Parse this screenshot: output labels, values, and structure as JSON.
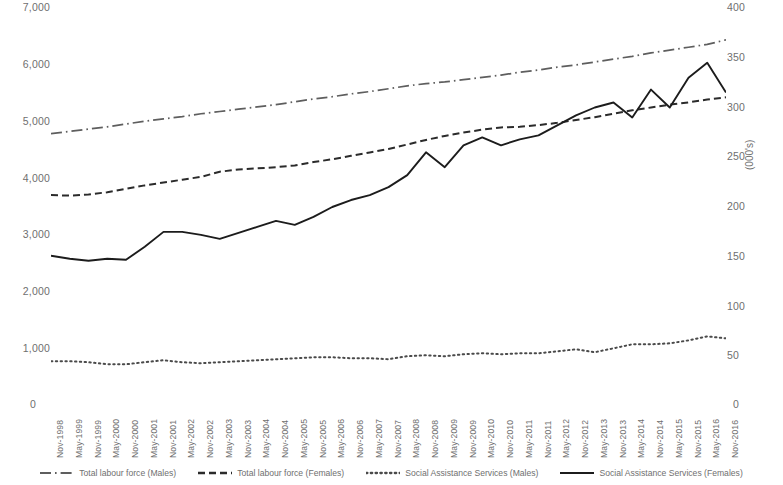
{
  "chart_data": {
    "type": "line",
    "title": "",
    "subtitle": "",
    "xlabel": "",
    "ylabel": "",
    "y2label": "(000's)",
    "ylim": [
      0,
      7000
    ],
    "y2lim": [
      0,
      400
    ],
    "grid": false,
    "legend_position": "bottom",
    "y_ticks_left": [
      "0",
      "1,000",
      "2,000",
      "3,000",
      "4,000",
      "5,000",
      "6,000",
      "7,000"
    ],
    "y_ticks_left_values": [
      0,
      1000,
      2000,
      3000,
      4000,
      5000,
      6000,
      7000
    ],
    "y_ticks_right": [
      "0",
      "50",
      "100",
      "150",
      "200",
      "250",
      "300",
      "350",
      "400"
    ],
    "y_ticks_right_values": [
      0,
      50,
      100,
      150,
      200,
      250,
      300,
      350,
      400
    ],
    "categories": [
      "Nov-1998",
      "May-1999",
      "Nov-1999",
      "May-2000",
      "Nov-2000",
      "May-2001",
      "Nov-2001",
      "May-2002",
      "Nov-2002",
      "May-2003",
      "Nov-2003",
      "May-2004",
      "Nov-2004",
      "May-2005",
      "Nov-2005",
      "May-2006",
      "Nov-2006",
      "May-2007",
      "Nov-2007",
      "May-2008",
      "Nov-2008",
      "May-2009",
      "Nov-2009",
      "May-2010",
      "Nov-2010",
      "May-2011",
      "Nov-2011",
      "May-2012",
      "Nov-2012",
      "May-2013",
      "Nov-2013",
      "May-2014",
      "Nov-2014",
      "May-2015",
      "Nov-2015",
      "May-2016",
      "Nov-2016"
    ],
    "series": [
      {
        "name": "Total labour force (Males)",
        "axis": "left",
        "style": "dash-dot",
        "color": "#5e5e5e",
        "values": [
          4790,
          4830,
          4870,
          4910,
          4960,
          5010,
          5050,
          5090,
          5140,
          5180,
          5220,
          5260,
          5300,
          5350,
          5400,
          5440,
          5490,
          5530,
          5580,
          5630,
          5670,
          5700,
          5740,
          5780,
          5820,
          5870,
          5910,
          5960,
          6000,
          6050,
          6100,
          6150,
          6210,
          6260,
          6310,
          6360,
          6440
        ]
      },
      {
        "name": "Total labour force (Females)",
        "axis": "left",
        "style": "dashed",
        "color": "#2b2b2b",
        "values": [
          3710,
          3700,
          3720,
          3760,
          3820,
          3880,
          3930,
          3980,
          4030,
          4120,
          4160,
          4180,
          4200,
          4230,
          4290,
          4340,
          4400,
          4460,
          4520,
          4600,
          4680,
          4750,
          4810,
          4860,
          4900,
          4910,
          4940,
          4980,
          5030,
          5080,
          5140,
          5200,
          5250,
          5300,
          5340,
          5390,
          5430
        ]
      },
      {
        "name": "Social Assistance Services (Males)",
        "axis": "right",
        "style": "dotted",
        "color": "#4a4a4a",
        "values": [
          45,
          45,
          44,
          42,
          42,
          44,
          46,
          44,
          43,
          44,
          45,
          46,
          47,
          48,
          49,
          49,
          48,
          48,
          47,
          50,
          51,
          50,
          52,
          53,
          52,
          53,
          53,
          55,
          57,
          54,
          58,
          62,
          62,
          63,
          66,
          70,
          68
        ]
      },
      {
        "name": "Social Assistance Services (Females)",
        "axis": "right",
        "style": "solid",
        "color": "#1c1c1c",
        "values": [
          151,
          148,
          146,
          148,
          147,
          160,
          175,
          175,
          172,
          168,
          174,
          180,
          186,
          182,
          190,
          200,
          207,
          212,
          220,
          232,
          255,
          240,
          262,
          270,
          262,
          268,
          272,
          282,
          292,
          300,
          305,
          290,
          318,
          300,
          330,
          345,
          315
        ]
      }
    ]
  },
  "legend": {
    "items": [
      {
        "label": "Total labour force (Males)",
        "style": "dash-dot"
      },
      {
        "label": "Total labour force (Females)",
        "style": "dashed"
      },
      {
        "label": "Social Assistance Services (Males)",
        "style": "dotted"
      },
      {
        "label": "Social Assistance Services (Females)",
        "style": "solid"
      }
    ]
  },
  "axes": {
    "right_title": "(000's)",
    "zero_left": "0",
    "zero_right": "0"
  }
}
